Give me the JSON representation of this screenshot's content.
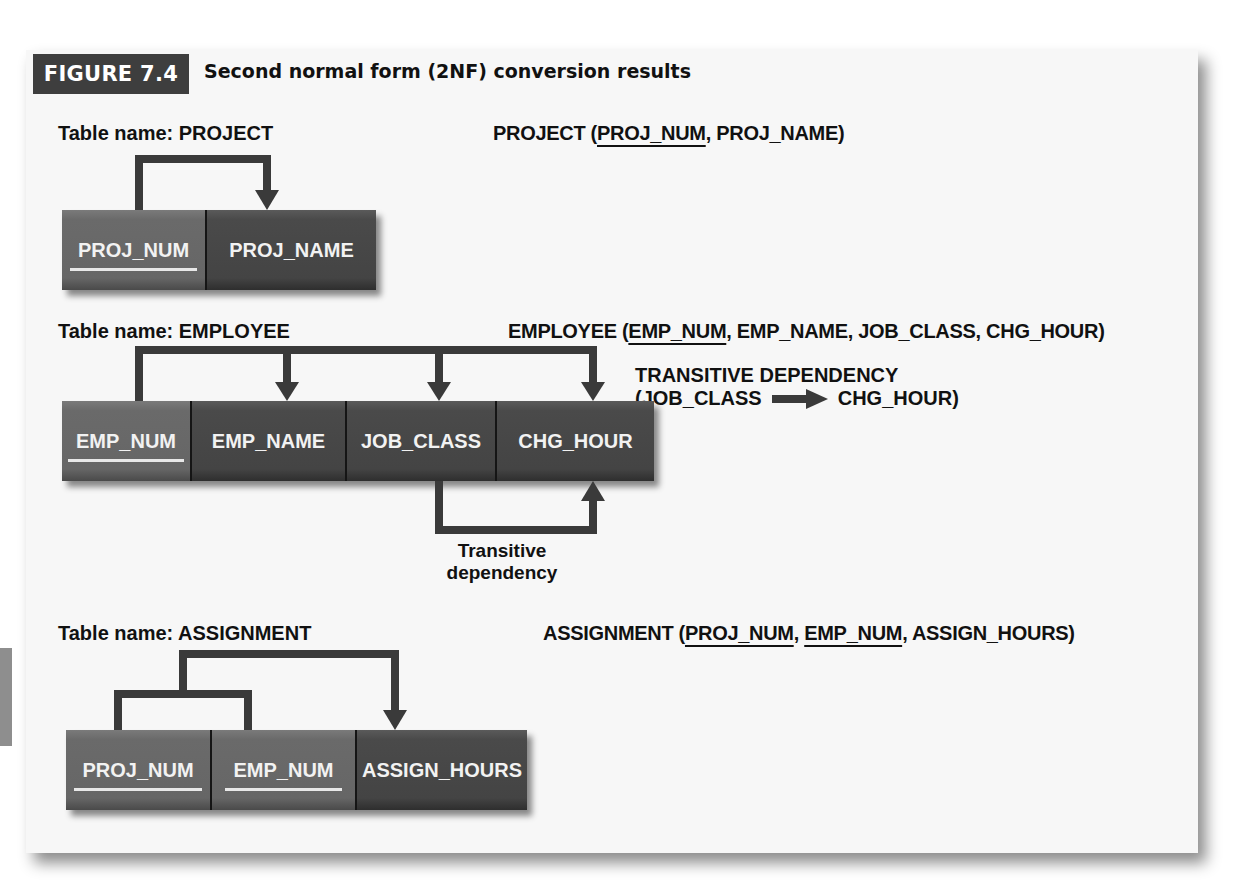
{
  "figure": {
    "badge": "FIGURE 7.4",
    "title": "Second normal form (2NF) conversion results"
  },
  "project": {
    "table_label": "Table name: PROJECT",
    "schema_name": "PROJECT (",
    "schema_keys": [
      "PROJ_NUM"
    ],
    "schema_rest": ", PROJ_NAME)",
    "columns": [
      {
        "name": "PROJ_NUM",
        "key": true
      },
      {
        "name": "PROJ_NAME",
        "key": false
      }
    ]
  },
  "employee": {
    "table_label": "Table name: EMPLOYEE",
    "schema_name": "EMPLOYEE (",
    "schema_keys": [
      "EMP_NUM"
    ],
    "schema_rest": ", EMP_NAME, JOB_CLASS, CHG_HOUR)",
    "columns": [
      {
        "name": "EMP_NUM",
        "key": true
      },
      {
        "name": "EMP_NAME",
        "key": false
      },
      {
        "name": "JOB_CLASS",
        "key": false
      },
      {
        "name": "CHG_HOUR",
        "key": false
      }
    ],
    "transitive_heading": "TRANSITIVE DEPENDENCY",
    "transitive_from": "(JOB_CLASS",
    "transitive_to": "CHG_HOUR)",
    "transitive_note_line1": "Transitive",
    "transitive_note_line2": "dependency"
  },
  "assignment": {
    "table_label": "Table name: ASSIGNMENT",
    "schema_name": "ASSIGNMENT (",
    "schema_key1": "PROJ_NUM",
    "schema_sep": ", ",
    "schema_key2": "EMP_NUM",
    "schema_rest": ", ASSIGN_HOURS)",
    "columns": [
      {
        "name": "PROJ_NUM",
        "key": true
      },
      {
        "name": "EMP_NUM",
        "key": true
      },
      {
        "name": "ASSIGN_HOURS",
        "key": false
      }
    ]
  },
  "colors": {
    "key_cell": "#666666",
    "nonkey_cell": "#444444",
    "badge_bg": "#3e3e3e",
    "arrow": "#3a3a3a"
  }
}
